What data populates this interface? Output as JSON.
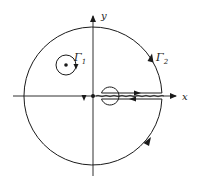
{
  "diagram": {
    "type": "contour-integration-keyhole",
    "axes": {
      "x_label": "x",
      "y_label": "y"
    },
    "contours": [
      {
        "name": "Γ1",
        "label_main": "Γ",
        "label_sub": "1",
        "description": "small closed circle around an interior point, counterclockwise"
      },
      {
        "name": "Γ2",
        "label_main": "Γ",
        "label_sub": "2",
        "description": "large outer circle with keyhole cut along positive x-axis, counterclockwise"
      }
    ],
    "branch_cut": "wavy line along positive real axis",
    "colors": {
      "stroke": "#1a1a1a",
      "background": "#ffffff"
    }
  }
}
